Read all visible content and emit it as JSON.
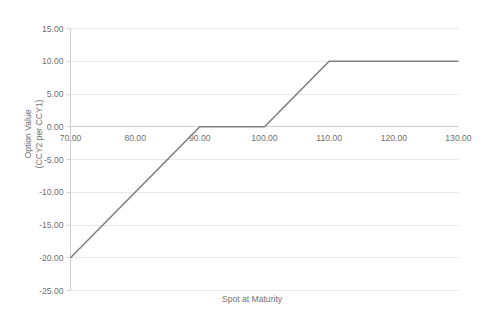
{
  "chart_data": {
    "type": "line",
    "title": "",
    "subtitle": "",
    "xlabel": "Spot at Maturity",
    "ylabel": "Option Value (CCY2 per CCY1)",
    "ylabel_line1": "Option Value",
    "ylabel_line2": "(CCY2 per CCY1)",
    "xlim": [
      70,
      130
    ],
    "ylim": [
      -25,
      15
    ],
    "x_tick_step": 10,
    "y_tick_step": 5,
    "grid": true,
    "grid_axis": "y",
    "legend": false,
    "legend_position": "none",
    "x_ticks": [
      70,
      80,
      90,
      100,
      110,
      120,
      130
    ],
    "y_ticks": [
      15,
      10,
      5,
      0,
      -5,
      -10,
      -15,
      -20,
      -25
    ],
    "x_tick_labels": [
      "70.00",
      "80.00",
      "90.00",
      "100.00",
      "110.00",
      "120.00",
      "130.00"
    ],
    "y_tick_labels": [
      "15.00",
      "10.00",
      "5.00",
      "0.00",
      "-5.00",
      "-10.00",
      "-15.00",
      "-20.00",
      "-25.00"
    ],
    "x_axis_position": "zero",
    "series": [
      {
        "name": "Option Value",
        "color": "#808080",
        "x": [
          70,
          90,
          100,
          110,
          130
        ],
        "values": [
          -20,
          0,
          0,
          10,
          10
        ]
      }
    ]
  },
  "colors": {
    "line": "#808080",
    "gridline": "#e8e8e8",
    "axis": "#d0d0d0",
    "text": "#707070",
    "background": "#ffffff"
  }
}
